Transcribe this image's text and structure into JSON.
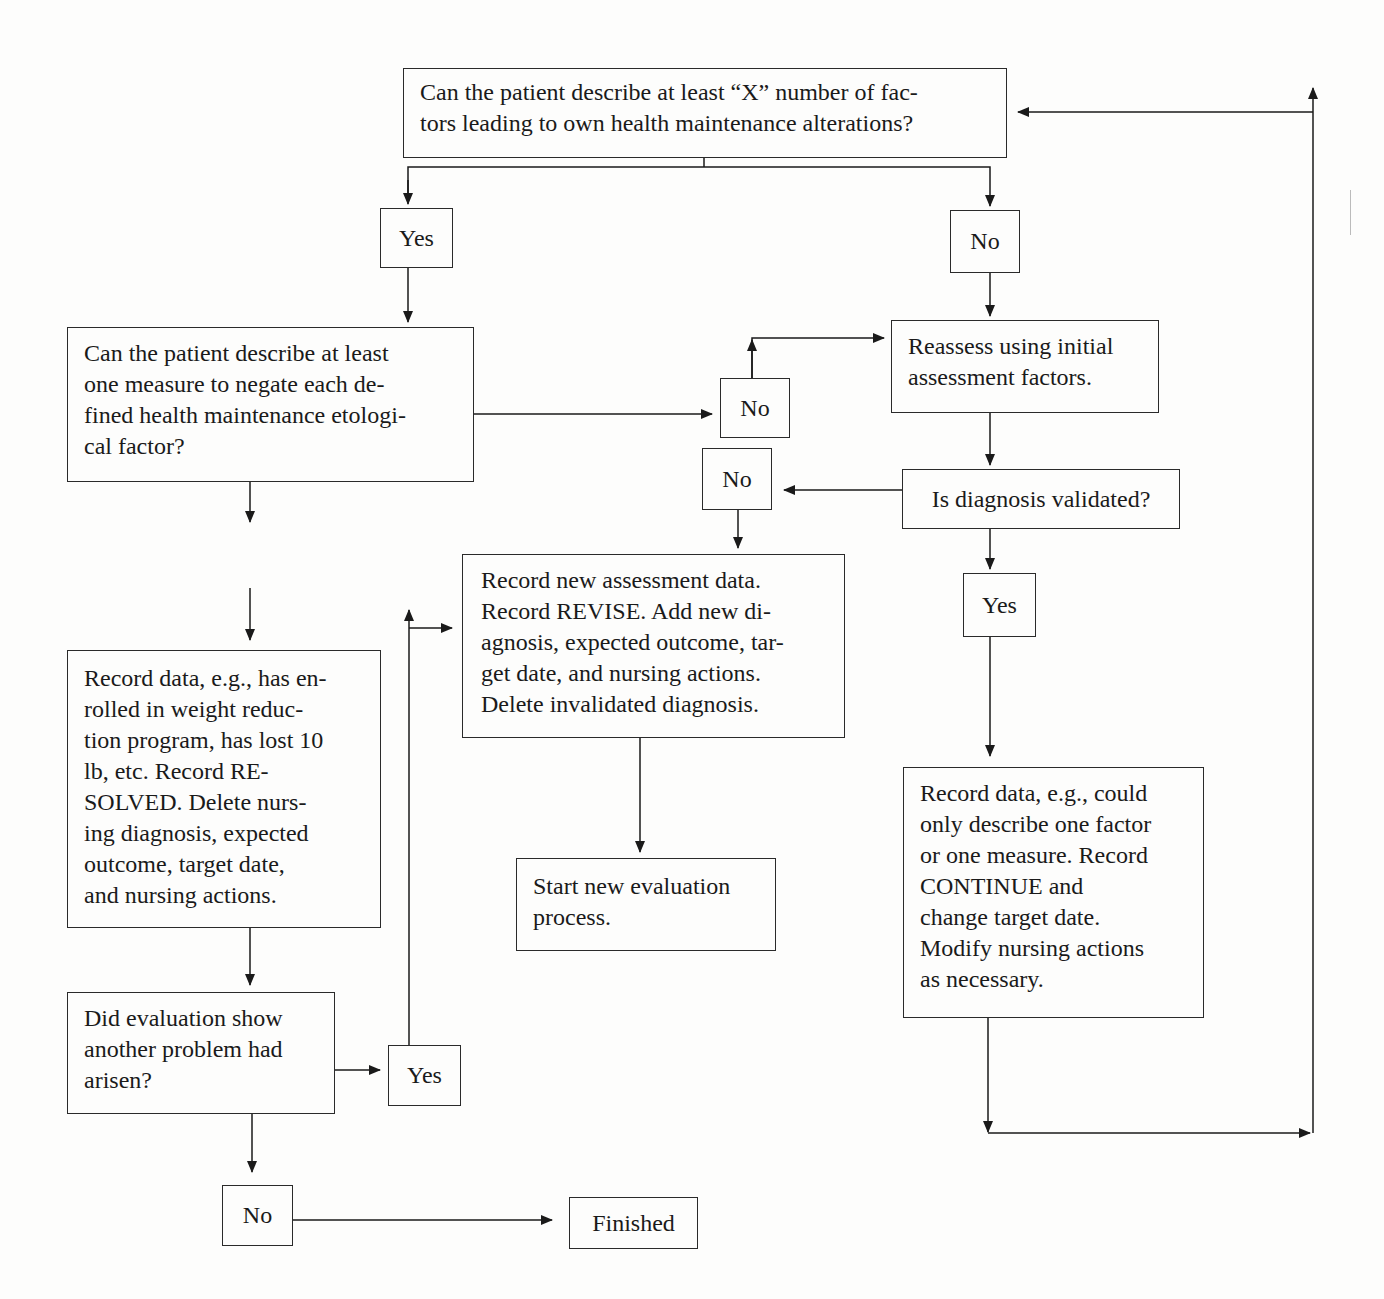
{
  "nodes": {
    "q_factors": "Can the patient describe at least “X” number of fac-\ntors leading to own health maintenance alterations?",
    "yes_1": "Yes",
    "no_1": "No",
    "q_measures": "Can the patient describe at least\none measure to negate each de-\nfined health maintenance etologi-\ncal factor?",
    "no_2": "No",
    "reassess": "Reassess using initial\nassessment factors.",
    "no_3": "No",
    "q_validated": "Is diagnosis validated?",
    "yes_2": "Yes",
    "record_revise": "Record new assessment data.\nRecord REVISE. Add new di-\nagnosis, expected outcome, tar-\nget date, and nursing actions.\nDelete invalidated diagnosis.",
    "record_resolved": "Record data, e.g., has en-\nrolled in weight reduc-\ntion program, has lost 10\nlb, etc. Record RE-\nSOLVED. Delete nurs-\ning diagnosis, expected\noutcome, target date,\nand nursing actions.",
    "start_new": "Start new evaluation\nprocess.",
    "record_continue": "Record data, e.g., could\nonly describe one factor\nor one measure. Record\nCONTINUE and\nchange target date.\nModify nursing actions\nas necessary.",
    "q_another_problem": "Did evaluation show\nanother problem had\narisen?",
    "yes_3": "Yes",
    "no_4": "No",
    "finished": "Finished"
  },
  "edges": [
    {
      "from": "q_factors",
      "to": "yes_1"
    },
    {
      "from": "q_factors",
      "to": "no_1"
    },
    {
      "from": "yes_1",
      "to": "q_measures"
    },
    {
      "from": "no_1",
      "to": "reassess"
    },
    {
      "from": "q_measures",
      "to": "no_2"
    },
    {
      "from": "no_2",
      "to": "reassess"
    },
    {
      "from": "reassess",
      "to": "q_validated"
    },
    {
      "from": "q_validated",
      "to": "no_3"
    },
    {
      "from": "q_validated",
      "to": "yes_2"
    },
    {
      "from": "no_3",
      "to": "record_revise"
    },
    {
      "from": "record_revise",
      "to": "start_new"
    },
    {
      "from": "yes_2",
      "to": "record_continue"
    },
    {
      "from": "record_continue",
      "to": "q_factors"
    },
    {
      "from": "q_measures",
      "to": "record_resolved",
      "label": "Yes"
    },
    {
      "from": "record_resolved",
      "to": "q_another_problem"
    },
    {
      "from": "q_another_problem",
      "to": "yes_3"
    },
    {
      "from": "yes_3",
      "to": "record_revise"
    },
    {
      "from": "q_another_problem",
      "to": "no_4"
    },
    {
      "from": "no_4",
      "to": "finished"
    }
  ],
  "colors": {
    "line": "#1a1a1a",
    "paper": "#fdfdfc"
  }
}
